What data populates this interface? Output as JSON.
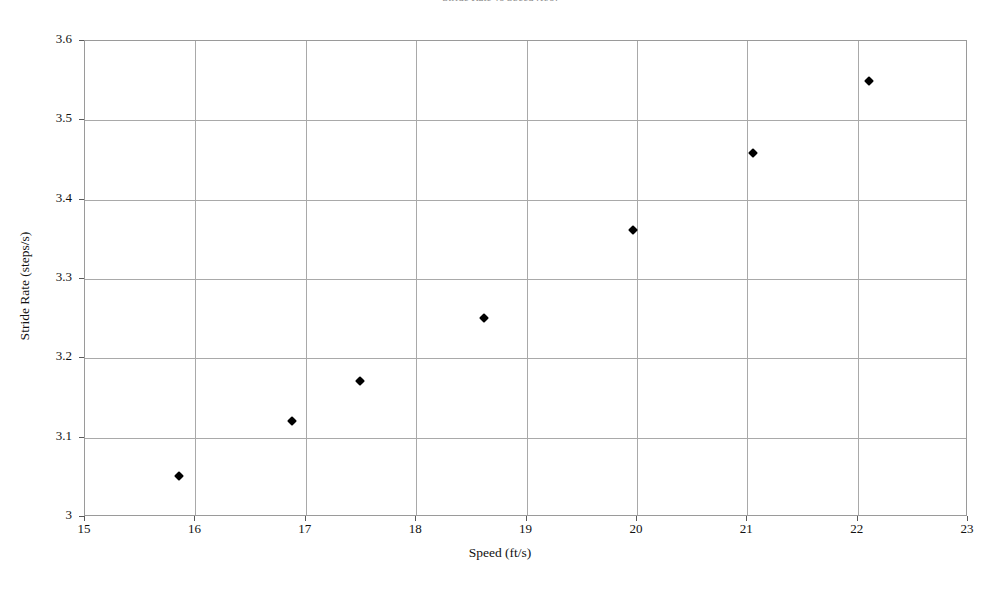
{
  "chart_data": {
    "type": "scatter",
    "title": "Stride Rate vs Speed (ft/s)",
    "xlabel": "Speed (ft/s)",
    "ylabel": "Stride Rate (steps/s)",
    "xlim": [
      15,
      23
    ],
    "ylim": [
      3,
      3.6
    ],
    "xticks": [
      "15",
      "16",
      "17",
      "18",
      "19",
      "20",
      "21",
      "22",
      "23"
    ],
    "yticks": [
      "3",
      "3.1",
      "3.2",
      "3.3",
      "3.4",
      "3.5",
      "3.6"
    ],
    "grid": "both",
    "legend": "none",
    "marker": "filled-diamond",
    "marker_color": "#000000",
    "series": [
      {
        "name": "Stride Rate",
        "points": [
          {
            "x": 15.86,
            "y": 3.05
          },
          {
            "x": 16.88,
            "y": 3.12
          },
          {
            "x": 17.5,
            "y": 3.17
          },
          {
            "x": 18.62,
            "y": 3.25
          },
          {
            "x": 19.97,
            "y": 3.36
          },
          {
            "x": 21.06,
            "y": 3.458
          },
          {
            "x": 22.11,
            "y": 3.548
          }
        ]
      }
    ]
  },
  "axes": {
    "x_title": "Speed (ft/s)",
    "y_title": "Stride Rate (steps/s)",
    "x_tick_labels": [
      "15",
      "16",
      "17",
      "18",
      "19",
      "20",
      "21",
      "22",
      "23"
    ],
    "y_tick_labels": [
      "3.6",
      "3.5",
      "3.4",
      "3.3",
      "3.2",
      "3.1",
      "3"
    ]
  },
  "title_clipped": "Stride Rate vs Speed (ft/s)"
}
